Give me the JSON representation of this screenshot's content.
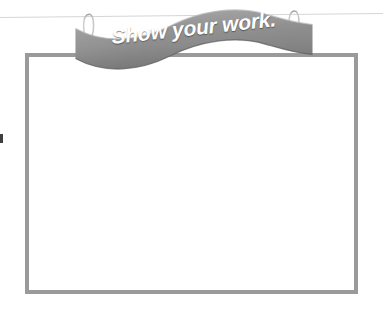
{
  "page": {
    "background_color": "#ffffff",
    "width": 383,
    "height": 312
  },
  "sign": {
    "label": "Show your work.",
    "shape": "wavy-hanging-banner",
    "fill_color": "#8a8a8a",
    "fill_color_light": "#a6a6a6",
    "fill_color_dark": "#6f6f6f",
    "text_color": "#ffffff"
  },
  "hooks": {
    "left_label": "left-hook",
    "right_label": "right-hook",
    "color": "#b5b5b5"
  },
  "wire": {
    "label": "hanging-wire",
    "color": "#d6d6d6"
  },
  "work_box": {
    "label": "work-area",
    "border_color": "#9a9a9a",
    "fill_color": "#ffffff",
    "contents": ""
  },
  "margin_mark": {
    "label": "margin-mark",
    "color": "#3f3f3f"
  }
}
